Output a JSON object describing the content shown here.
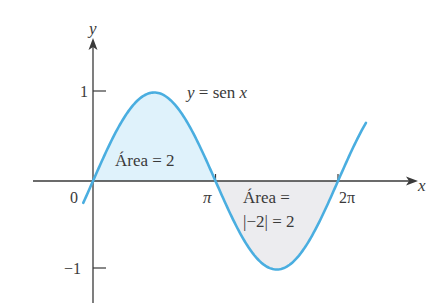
{
  "chart_data": {
    "type": "area",
    "title": "",
    "function_label": "y = sen x",
    "xlabel": "x",
    "ylabel": "y",
    "x_ticks": [
      {
        "value": 0,
        "label": "0"
      },
      {
        "value": 3.14159,
        "label": "π"
      },
      {
        "value": 6.28318,
        "label": "2π"
      }
    ],
    "y_ticks": [
      {
        "value": 1,
        "label": "1"
      },
      {
        "value": -1,
        "label": "−1"
      }
    ],
    "xlim": [
      -0.3,
      7.3
    ],
    "ylim": [
      -1.3,
      1.6
    ],
    "series": [
      {
        "name": "y = sen x",
        "x_range": [
          -0.25,
          7.0
        ],
        "function": "sin(x)",
        "color": "#4aaee0"
      }
    ],
    "shaded_regions": [
      {
        "x_range": [
          0,
          3.14159
        ],
        "label_line1": "Área = 2",
        "color": "#dff2fb"
      },
      {
        "x_range": [
          3.14159,
          6.28318
        ],
        "label_line1": "Área =",
        "label_line2": "|−2| = 2",
        "color": "#ececef"
      }
    ],
    "grid": false,
    "legend": "none"
  },
  "labels": {
    "y_axis": "y",
    "x_axis": "x",
    "origin": "0",
    "pi": "π",
    "two_pi": "2π",
    "y_one": "1",
    "y_minus_one": "−1",
    "curve_y": "y",
    "curve_eq": " = sen ",
    "curve_x": "x",
    "area_pos": "Área = 2",
    "area_neg_1": "Área =",
    "area_neg_2": "|−2| = 2"
  }
}
